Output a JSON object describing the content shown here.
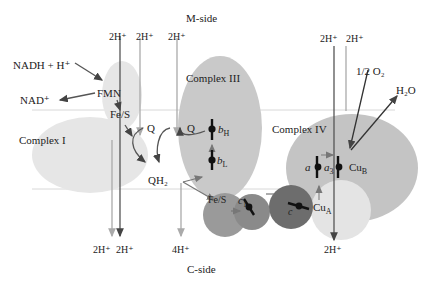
{
  "sides": {
    "m_side": "M-side",
    "c_side": "C-side"
  },
  "complexes": {
    "complex1": "Complex I",
    "complex3": "Complex III",
    "complex4": "Complex IV"
  },
  "labels": {
    "nadh": "NADH + H⁺",
    "nad": "NAD⁺",
    "fmn": "FMN",
    "fes1": "Fe/S",
    "q1": "Q",
    "q2": "Q",
    "qh2": "QH₂",
    "bh": "b",
    "bh_sub": "H",
    "bl": "b",
    "bl_sub": "L",
    "fes2": "Fe/S",
    "c1": "c",
    "c1_sub": "1",
    "c": "c",
    "cua": "Cu",
    "cua_sub": "A",
    "a": "a",
    "a3": "a",
    "a3_sub": "3",
    "cub": "Cu",
    "cub_sub": "B",
    "o2": "1/2 O₂",
    "h2o": "H₂O"
  },
  "protons": {
    "top1": "2H⁺",
    "top2": "2H⁺",
    "top3": "2H⁺",
    "top4": "2H⁺",
    "top5": "2H⁺",
    "bot1": "2H⁺",
    "bot2": "2H⁺",
    "bot3": "4H⁺",
    "bot4": "2H⁺"
  },
  "colors": {
    "complex1": "#e6e6e6",
    "complex3": "#c9c9c9",
    "complex4": "#c4c4c4",
    "cua": "#e4e4e4",
    "fes2": "#9a9a9a",
    "c1": "#8a8a8a",
    "c": "#6d6d6d",
    "membrane": "#d8d8d8",
    "arrow_dark": "#444444",
    "arrow_light": "#aaaaaa"
  }
}
